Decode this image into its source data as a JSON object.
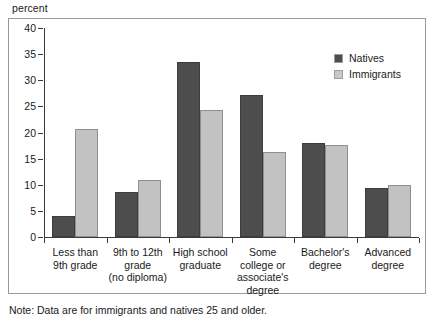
{
  "chart_data": {
    "type": "bar",
    "title": "",
    "ylabel": "percent",
    "xlabel": "",
    "ylim": [
      0,
      40
    ],
    "yticks": [
      0,
      5,
      10,
      15,
      20,
      25,
      30,
      35,
      40
    ],
    "grid": false,
    "legend_position": "top-right",
    "categories": [
      "Less than\n9th grade",
      "9th to 12th\ngrade\n(no diploma)",
      "High school\ngraduate",
      "Some\ncollege or\nassociate's\ndegree",
      "Bachelor's\ndegree",
      "Advanced\ndegree"
    ],
    "category_lines": [
      [
        "Less than",
        "9th grade"
      ],
      [
        "9th to 12th",
        "grade",
        "(no diploma)"
      ],
      [
        "High school",
        "graduate"
      ],
      [
        "Some",
        "college or",
        "associate's",
        "degree"
      ],
      [
        "Bachelor's",
        "degree"
      ],
      [
        "Advanced",
        "degree"
      ]
    ],
    "series": [
      {
        "name": "Natives",
        "color": "#4d4d4d",
        "values": [
          4.0,
          8.6,
          33.5,
          27.2,
          18.0,
          9.4
        ]
      },
      {
        "name": "Immigrants",
        "color": "#c2c2c2",
        "values": [
          20.7,
          10.9,
          24.3,
          16.3,
          17.7,
          10.0
        ]
      }
    ],
    "note": "Note: Data are for immigrants and natives 25 and older."
  },
  "axis": {
    "y_label": "percent",
    "y_ticks": [
      "0",
      "5",
      "10",
      "15",
      "20",
      "25",
      "30",
      "35",
      "40"
    ]
  },
  "legend": {
    "items": [
      {
        "label": "Natives"
      },
      {
        "label": "Immigrants"
      }
    ]
  },
  "footer": {
    "note": "Note: Data are for immigrants and natives 25 and older."
  }
}
